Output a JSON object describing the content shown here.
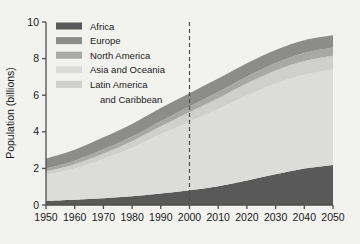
{
  "chart_data": {
    "type": "area",
    "stacked": true,
    "title": "",
    "xlabel": "",
    "ylabel": "Population (billions)",
    "xlim": [
      1950,
      2050
    ],
    "ylim": [
      0,
      10
    ],
    "yticks": [
      0,
      2,
      4,
      6,
      8,
      10
    ],
    "xticks": [
      1950,
      1960,
      1970,
      1980,
      1990,
      2000,
      2010,
      2020,
      2030,
      2040,
      2050
    ],
    "xtick_labels": [
      "1950",
      "1960",
      "1970",
      "1980",
      "1990",
      "2000",
      "2010",
      "2020",
      "2030",
      "2040",
      "2050"
    ],
    "ytick_labels": [
      "0",
      "2",
      "4",
      "6",
      "8",
      "10"
    ],
    "grid": false,
    "legend_position": "top-left",
    "annotations": [
      {
        "type": "vertical-dashed-line",
        "x": 2000,
        "label": ""
      }
    ],
    "x": [
      1950,
      1960,
      1970,
      1980,
      1990,
      2000,
      2010,
      2020,
      2030,
      2040,
      2050
    ],
    "series": [
      {
        "name": "Africa",
        "color": "#595959",
        "stack_order": 1,
        "values": [
          0.23,
          0.29,
          0.37,
          0.48,
          0.63,
          0.81,
          1.03,
          1.34,
          1.68,
          1.99,
          2.19
        ]
      },
      {
        "name": "Asia and Oceania",
        "color": "#dcdcda",
        "stack_order": 2,
        "values": [
          1.42,
          1.71,
          2.15,
          2.65,
          3.23,
          3.74,
          4.21,
          4.64,
          4.96,
          5.14,
          5.22
        ]
      },
      {
        "name": "Latin America and Caribbean",
        "color": "#cfcfcc",
        "stack_order": 3,
        "values": [
          0.17,
          0.22,
          0.29,
          0.36,
          0.44,
          0.52,
          0.59,
          0.66,
          0.71,
          0.74,
          0.75
        ]
      },
      {
        "name": "North America",
        "color": "#a8a8a6",
        "stack_order": 4,
        "values": [
          0.17,
          0.2,
          0.23,
          0.25,
          0.28,
          0.31,
          0.34,
          0.38,
          0.41,
          0.44,
          0.45
        ]
      },
      {
        "name": "Europe",
        "color": "#8c8c8a",
        "stack_order": 5,
        "values": [
          0.55,
          0.6,
          0.66,
          0.69,
          0.72,
          0.73,
          0.74,
          0.73,
          0.71,
          0.69,
          0.66
        ]
      }
    ],
    "totals": [
      2.54,
      3.02,
      3.7,
      4.43,
      5.3,
      6.11,
      6.91,
      7.75,
      8.47,
      9.0,
      9.27
    ]
  },
  "legend": {
    "items": [
      {
        "label": "Africa",
        "color": "#595959"
      },
      {
        "label": "Europe",
        "color": "#8c8c8a"
      },
      {
        "label": "North America",
        "color": "#a8a8a6"
      },
      {
        "label": "Asia and Oceania",
        "color": "#dcdcda"
      },
      {
        "label": "Latin America",
        "color": "#cfcfcc"
      },
      {
        "label": "and Caribbean",
        "color": ""
      }
    ]
  },
  "axes": {
    "y_title": "Population (billions)",
    "y_ticks": [
      "10",
      "8",
      "6",
      "4",
      "2",
      "0"
    ],
    "x_ticks": [
      "1950",
      "1960",
      "1970",
      "1980",
      "1990",
      "2000",
      "2010",
      "2020",
      "2030",
      "2040",
      "2050"
    ]
  },
  "colors": {
    "background": "#f2f2ef",
    "axis": "#4d4d4d",
    "text": "#1a1a1a",
    "dashed_line": "#4d4d4d"
  }
}
